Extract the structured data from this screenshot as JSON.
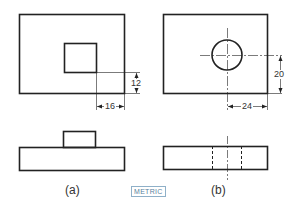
{
  "figure": {
    "views": [
      {
        "id": "a",
        "caption": "(a)",
        "dimensions": [
          {
            "value": "12",
            "orientation": "vertical"
          },
          {
            "value": "16",
            "orientation": "horizontal"
          }
        ],
        "feature": "square boss"
      },
      {
        "id": "b",
        "caption": "(b)",
        "dimensions": [
          {
            "value": "20",
            "orientation": "vertical"
          },
          {
            "value": "24",
            "orientation": "horizontal"
          }
        ],
        "feature": "through hole"
      }
    ],
    "units_badge": "METRIC"
  }
}
